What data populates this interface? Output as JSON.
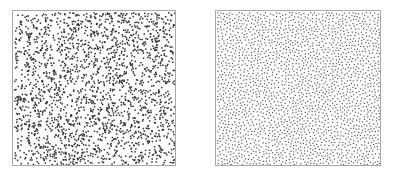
{
  "chart_data": [
    {
      "type": "scatter",
      "title": "",
      "description": "Uniform random (white noise) point distribution showing clumping and voids",
      "xlabel": "",
      "ylabel": "",
      "grid": false,
      "legend": null,
      "point_count_estimate": 2200,
      "point_color": "#333333",
      "point_size": 1.5,
      "distribution": "random",
      "seed": 12345
    },
    {
      "type": "scatter",
      "title": "",
      "description": "Blue-noise (Poisson-disk) point distribution with evenly spaced points",
      "xlabel": "",
      "ylabel": "",
      "grid": false,
      "legend": null,
      "point_count_estimate": 3200,
      "point_color": "#555555",
      "point_size": 1.2,
      "distribution": "poisson-disk",
      "min_distance": 2.6,
      "seed": 67890
    }
  ],
  "panels": [
    {
      "id": "left",
      "label": "random-point-distribution"
    },
    {
      "id": "right",
      "label": "blue-noise-point-distribution"
    }
  ]
}
